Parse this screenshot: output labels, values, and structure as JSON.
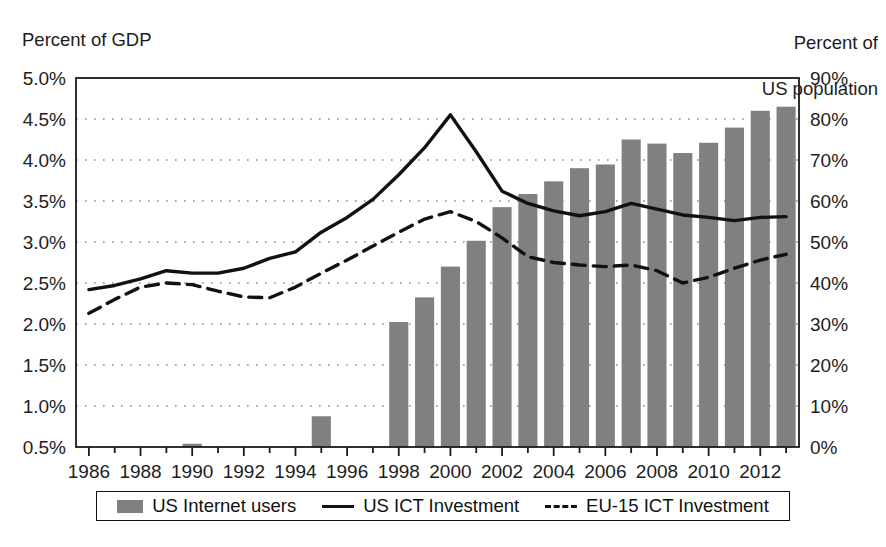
{
  "figure": {
    "left_axis_caption": "Percent of GDP",
    "right_axis_caption_line1": "Percent of",
    "right_axis_caption_line2": "US population",
    "footer_note": ""
  },
  "legend": {
    "items": [
      {
        "label": "US Internet users",
        "marker": "bar-swatch",
        "color": "#808080"
      },
      {
        "label": "US ICT Investment",
        "marker": "solid-line-swatch",
        "color": "#111111"
      },
      {
        "label": "EU-15 ICT Investment",
        "marker": "dashed-line-swatch",
        "color": "#111111"
      }
    ]
  },
  "chart_data": {
    "type": "bar",
    "title": "",
    "xlabel": "",
    "ylabel": "Percent of GDP",
    "y2label": "Percent of US population",
    "grid": true,
    "legend_position": "bottom",
    "x": [
      1986,
      1987,
      1988,
      1989,
      1990,
      1991,
      1992,
      1993,
      1994,
      1995,
      1996,
      1997,
      1998,
      1999,
      2000,
      2001,
      2002,
      2003,
      2004,
      2005,
      2006,
      2007,
      2008,
      2009,
      2010,
      2011,
      2012,
      2013
    ],
    "xtick_labels": [
      "1986",
      "1988",
      "1990",
      "1992",
      "1994",
      "1996",
      "1998",
      "2000",
      "2002",
      "2004",
      "2006",
      "2008",
      "2010",
      "2012"
    ],
    "xticks": [
      1986,
      1988,
      1990,
      1992,
      1994,
      1996,
      1998,
      2000,
      2002,
      2004,
      2006,
      2008,
      2010,
      2012
    ],
    "ylim": [
      0.5,
      5.0
    ],
    "ytick_labels": [
      "0.5%",
      "1.0%",
      "1.5%",
      "2.0%",
      "2.5%",
      "3.0%",
      "3.5%",
      "4.0%",
      "4.5%",
      "5.0%"
    ],
    "yticks": [
      0.5,
      1.0,
      1.5,
      2.0,
      2.5,
      3.0,
      3.5,
      4.0,
      4.5,
      5.0
    ],
    "y2lim": [
      0,
      90
    ],
    "y2tick_labels": [
      "0%",
      "10%",
      "20%",
      "30%",
      "40%",
      "50%",
      "60%",
      "70%",
      "80%",
      "90%"
    ],
    "y2ticks": [
      0,
      10,
      20,
      30,
      40,
      50,
      60,
      70,
      80,
      90
    ],
    "series": [
      {
        "name": "US Internet users",
        "type": "bar",
        "axis": "right",
        "unit": "percent of US population",
        "color": "#808080",
        "values": [
          0,
          0,
          0,
          0,
          0.8,
          0,
          0,
          0,
          0,
          7.5,
          0,
          0,
          30.5,
          36.5,
          44.0,
          50.3,
          58.5,
          61.7,
          64.8,
          68.0,
          68.9,
          75.0,
          74.0,
          71.7,
          74.2,
          77.9,
          82.0,
          83.0
        ]
      },
      {
        "name": "US ICT Investment",
        "type": "line",
        "style": "solid",
        "axis": "left",
        "unit": "percent of GDP",
        "color": "#111111",
        "values": [
          2.42,
          2.47,
          2.55,
          2.65,
          2.62,
          2.62,
          2.68,
          2.8,
          2.88,
          3.12,
          3.3,
          3.52,
          3.82,
          4.15,
          4.55,
          4.1,
          3.62,
          3.47,
          3.38,
          3.32,
          3.37,
          3.47,
          3.4,
          3.33,
          3.3,
          3.26,
          3.3,
          3.31
        ]
      },
      {
        "name": "EU-15 ICT Investment",
        "type": "line",
        "style": "dashed",
        "axis": "left",
        "unit": "percent of GDP",
        "color": "#111111",
        "values": [
          2.13,
          2.3,
          2.45,
          2.5,
          2.48,
          2.4,
          2.33,
          2.32,
          2.45,
          2.62,
          2.78,
          2.95,
          3.12,
          3.28,
          3.37,
          3.25,
          3.05,
          2.82,
          2.75,
          2.72,
          2.7,
          2.72,
          2.65,
          2.5,
          2.57,
          2.68,
          2.78,
          2.85
        ]
      }
    ]
  }
}
